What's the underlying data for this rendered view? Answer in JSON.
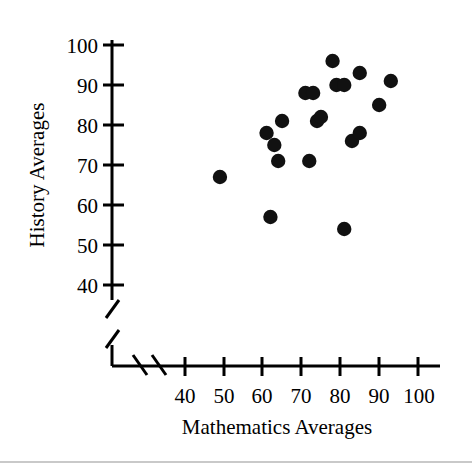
{
  "chart_data": {
    "type": "scatter",
    "title": "",
    "xlabel": "Mathematics Averages",
    "ylabel": "History Averages",
    "xlim": [
      36,
      104
    ],
    "ylim": [
      36,
      103
    ],
    "xticks": [
      40,
      50,
      60,
      70,
      80,
      90,
      100
    ],
    "yticks": [
      40,
      50,
      60,
      70,
      80,
      90,
      100
    ],
    "xtick_labels": [
      "40",
      "50",
      "60",
      "70",
      "80",
      "90",
      "100"
    ],
    "ytick_labels": [
      "40",
      "50",
      "60",
      "70",
      "80",
      "90",
      "100"
    ],
    "grid": false,
    "legend": null,
    "axis_break_x": true,
    "axis_break_y": true,
    "marker": "filled-circle",
    "marker_color": "#111111",
    "points": [
      {
        "x": 49,
        "y": 67
      },
      {
        "x": 61,
        "y": 78
      },
      {
        "x": 62,
        "y": 57
      },
      {
        "x": 63,
        "y": 75
      },
      {
        "x": 64,
        "y": 71
      },
      {
        "x": 65,
        "y": 81
      },
      {
        "x": 71,
        "y": 88
      },
      {
        "x": 72,
        "y": 71
      },
      {
        "x": 73,
        "y": 88
      },
      {
        "x": 74,
        "y": 81
      },
      {
        "x": 75,
        "y": 82
      },
      {
        "x": 78,
        "y": 96
      },
      {
        "x": 79,
        "y": 90
      },
      {
        "x": 81,
        "y": 90
      },
      {
        "x": 81,
        "y": 54
      },
      {
        "x": 83,
        "y": 76
      },
      {
        "x": 85,
        "y": 78
      },
      {
        "x": 85,
        "y": 93
      },
      {
        "x": 90,
        "y": 85
      },
      {
        "x": 93,
        "y": 91
      }
    ]
  },
  "axis": {
    "x_tick_labels": [
      "40",
      "50",
      "60",
      "70",
      "80",
      "90",
      "100"
    ],
    "y_tick_labels": [
      "100",
      "90",
      "80",
      "70",
      "60",
      "50",
      "40"
    ],
    "x_title": "Mathematics Averages",
    "y_title": "History Averages"
  }
}
